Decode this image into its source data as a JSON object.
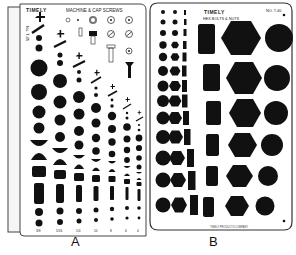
{
  "figure": {
    "captions": {
      "a": "A",
      "b": "B"
    }
  },
  "template_a": {
    "brand": "TIMELY",
    "title": "MACHINE & CAP SCREWS",
    "model": "No. T-45",
    "bottom_labels": [
      "3/8",
      "5/16",
      "1/4",
      "10",
      "8",
      "6",
      "4"
    ],
    "top_size_labels": [
      "3/4",
      "5/8",
      "1/2"
    ]
  },
  "template_b": {
    "brand": "TIMELY",
    "title": "HEX BOLTS & NUTS",
    "model": "NO. T-40",
    "right_labels": [
      "1-1/2",
      "1-3/8",
      "1-1/4",
      "1-1/8",
      "1",
      "7/8"
    ]
  },
  "colors": {
    "ink": "#111111",
    "plastic": "#ffffff",
    "outline": "#333333",
    "backing": "#f4f4f4"
  }
}
